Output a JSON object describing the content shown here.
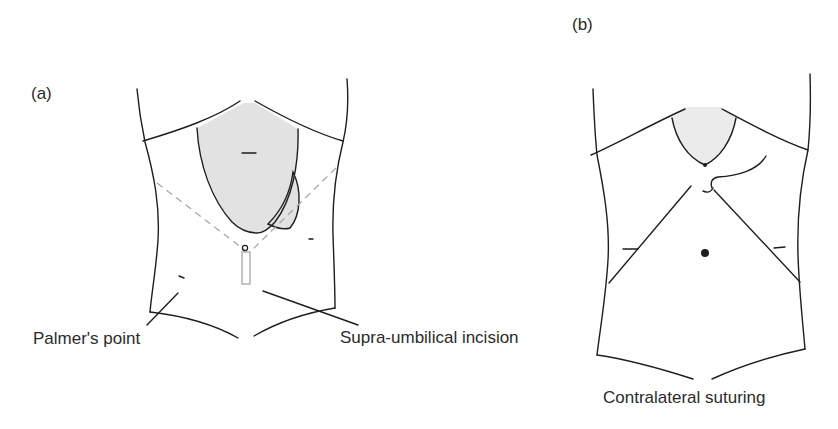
{
  "figure": {
    "panel_a": {
      "label": "(a)",
      "annotations": {
        "palmers_point": "Palmer's point",
        "supra_umbilical_incision": "Supra-umbilical incision"
      }
    },
    "panel_b": {
      "label": "(b)",
      "annotations": {
        "contralateral_suturing": "Contralateral suturing"
      }
    }
  },
  "colors": {
    "outline": "#1e1e1e",
    "shaded_organ": "#e2e2e2",
    "dashed_line": "#a8a8a8",
    "trocar_outline": "#a0a0a0",
    "text": "#2b2b2b",
    "background": "#ffffff"
  }
}
